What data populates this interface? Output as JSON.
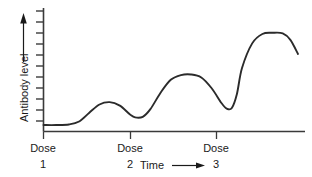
{
  "figure": {
    "background_color": "#ffffff",
    "line_color": "#2b2b2b",
    "axis_color": "#3a3a3a",
    "text_color": "#1a1a1a"
  },
  "axes": {
    "y_title": "Antibody level",
    "y_arrow_icon": "up-arrow-icon",
    "x_title": "Time",
    "x_arrow_icon": "right-arrow-icon",
    "y_tick_count": 11,
    "x_grid": false,
    "y_grid": false
  },
  "dose_markers": [
    {
      "label": "Dose",
      "number": "1",
      "x": 43
    },
    {
      "label": "Dose",
      "number": "2",
      "x": 130
    },
    {
      "label": "Dose",
      "number": "3",
      "x": 216
    }
  ],
  "chart_data": {
    "type": "line",
    "title": "",
    "subtitle": "",
    "xlabel": "Time",
    "ylabel": "Antibody level",
    "xlim": [
      0,
      10
    ],
    "ylim": [
      0,
      10
    ],
    "grid": false,
    "legend": null,
    "annotations": [
      "Dose 1",
      "Dose 2",
      "Dose 3"
    ],
    "series": [
      {
        "name": "Antibody level",
        "x": [
          0.0,
          0.5,
          1.0,
          1.4,
          1.8,
          2.2,
          2.6,
          3.0,
          3.4,
          3.6,
          3.9,
          4.2,
          4.6,
          5.0,
          5.4,
          5.8,
          6.2,
          6.6,
          7.0,
          7.2,
          7.4,
          7.6,
          7.8,
          8.2,
          8.6,
          9.0,
          9.4,
          9.7,
          10.0
        ],
        "y": [
          0.55,
          0.55,
          0.6,
          0.85,
          1.6,
          2.3,
          2.5,
          2.2,
          1.45,
          1.2,
          1.25,
          1.9,
          3.3,
          4.4,
          4.8,
          4.85,
          4.6,
          3.7,
          2.4,
          1.95,
          2.0,
          3.2,
          5.4,
          7.5,
          8.3,
          8.4,
          8.35,
          7.8,
          6.6
        ]
      }
    ],
    "features": {
      "baseline_level": 0.55,
      "peak_1_level": 2.5,
      "peak_2_level": 4.85,
      "peak_3_level": 8.4,
      "trough_1_level": 1.2,
      "trough_2_level": 1.95
    }
  }
}
